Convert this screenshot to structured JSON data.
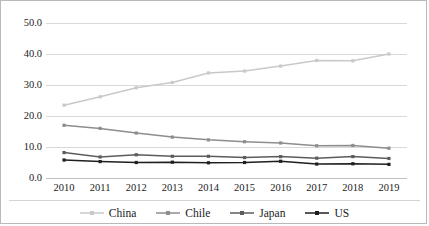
{
  "chart_data": {
    "type": "line",
    "title": "",
    "xlabel": "",
    "ylabel": "",
    "categories": [
      "2010",
      "2011",
      "2012",
      "2013",
      "2014",
      "2015",
      "2016",
      "2017",
      "2018",
      "2019"
    ],
    "x": [
      2010,
      2011,
      2012,
      2013,
      2014,
      2015,
      2016,
      2017,
      2018,
      2019
    ],
    "ylim": [
      0.0,
      50.0
    ],
    "yticks": [
      "0.0",
      "10.0",
      "20.0",
      "30.0",
      "40.0",
      "50.0"
    ],
    "ytick_values": [
      0.0,
      10.0,
      20.0,
      30.0,
      40.0,
      50.0
    ],
    "grid": true,
    "legend_position": "bottom",
    "series": [
      {
        "name": "China",
        "color": "#c9c9c9",
        "values": [
          23.5,
          26.2,
          29.1,
          30.8,
          33.9,
          34.5,
          36.1,
          37.9,
          37.8,
          40.0
        ]
      },
      {
        "name": "Chile",
        "color": "#8d8d8d",
        "values": [
          17.0,
          16.0,
          14.5,
          13.2,
          12.3,
          11.7,
          11.3,
          10.4,
          10.5,
          9.6
        ]
      },
      {
        "name": "Japan",
        "color": "#5c5c5c",
        "values": [
          8.2,
          6.8,
          7.5,
          7.0,
          7.0,
          6.6,
          6.9,
          6.4,
          6.9,
          6.3
        ]
      },
      {
        "name": "US",
        "color": "#1f1f1f",
        "values": [
          5.8,
          5.3,
          5.0,
          5.1,
          4.9,
          5.0,
          5.4,
          4.5,
          4.6,
          4.4
        ]
      }
    ]
  },
  "axis": {
    "y_labels": [
      "50.0",
      "40.0",
      "30.0",
      "20.0",
      "10.0",
      "0.0"
    ],
    "x_labels": [
      "2010",
      "2011",
      "2012",
      "2013",
      "2014",
      "2015",
      "2016",
      "2017",
      "2018",
      "2019"
    ]
  },
  "legend": {
    "items": [
      {
        "label": "China"
      },
      {
        "label": "Chile"
      },
      {
        "label": "Japan"
      },
      {
        "label": "US"
      }
    ]
  }
}
